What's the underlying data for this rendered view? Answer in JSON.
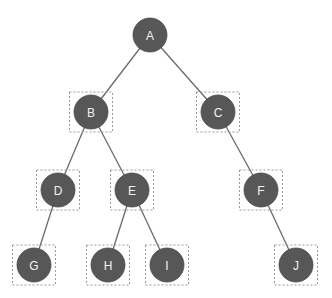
{
  "diagram": {
    "type": "binary-tree",
    "colors": {
      "node_fill": "#575757",
      "node_stroke": "#4a4a4a",
      "edge": "#6a6a6a",
      "highlight_box": "#9a9a9a",
      "label": "#f2f2f2"
    },
    "nodes": [
      {
        "id": "A",
        "label": "A",
        "x": 150,
        "y": 35,
        "boxed": false
      },
      {
        "id": "B",
        "label": "B",
        "x": 91,
        "y": 112,
        "boxed": true
      },
      {
        "id": "C",
        "label": "C",
        "x": 218,
        "y": 112,
        "boxed": true
      },
      {
        "id": "D",
        "label": "D",
        "x": 58,
        "y": 190,
        "boxed": true
      },
      {
        "id": "E",
        "label": "E",
        "x": 132,
        "y": 190,
        "boxed": true
      },
      {
        "id": "F",
        "label": "F",
        "x": 261,
        "y": 190,
        "boxed": true
      },
      {
        "id": "G",
        "label": "G",
        "x": 34,
        "y": 265,
        "boxed": true
      },
      {
        "id": "H",
        "label": "H",
        "x": 108,
        "y": 265,
        "boxed": true
      },
      {
        "id": "I",
        "label": "I",
        "x": 167,
        "y": 265,
        "boxed": true
      },
      {
        "id": "J",
        "label": "J",
        "x": 296,
        "y": 265,
        "boxed": true
      }
    ],
    "edges": [
      [
        "A",
        "B"
      ],
      [
        "A",
        "C"
      ],
      [
        "B",
        "D"
      ],
      [
        "B",
        "E"
      ],
      [
        "C",
        "F"
      ],
      [
        "D",
        "G"
      ],
      [
        "E",
        "H"
      ],
      [
        "E",
        "I"
      ],
      [
        "F",
        "J"
      ]
    ]
  }
}
